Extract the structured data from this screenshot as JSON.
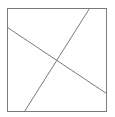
{
  "diagram": {
    "type": "geometric-figure",
    "background_color": "#ffffff",
    "stroke_color": "#7a7a7a",
    "square": {
      "x": 7,
      "y": 8,
      "width": 99,
      "height": 103
    },
    "lines": [
      {
        "name": "line-left-to-right",
        "x1": 7,
        "y1": 27,
        "x2": 106,
        "y2": 93
      },
      {
        "name": "line-top-to-bottom",
        "x1": 89,
        "y1": 8,
        "x2": 24,
        "y2": 111
      }
    ]
  }
}
